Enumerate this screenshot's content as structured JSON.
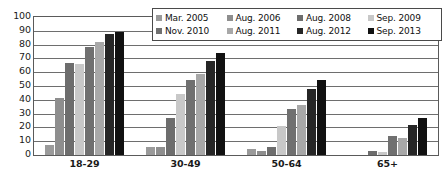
{
  "chart_data": {
    "type": "bar",
    "title": "",
    "xlabel": "",
    "ylabel": "",
    "ylim": [
      0,
      100
    ],
    "ytick_step": 10,
    "yticks": [
      "100",
      "90",
      "80",
      "70",
      "60",
      "50",
      "40",
      "30",
      "20",
      "10",
      "0"
    ],
    "grid": true,
    "legend_position": "top-right",
    "categories": [
      "18-29",
      "30-49",
      "50-64",
      "65+"
    ],
    "series": [
      {
        "name": "Mar. 2005",
        "color": "#9a9a9a",
        "values": [
          7,
          6,
          4,
          0
        ]
      },
      {
        "name": "Aug. 2006",
        "color": "#8e8e8e",
        "values": [
          41,
          6,
          3,
          0
        ]
      },
      {
        "name": "Aug. 2008",
        "color": "#6d6d6d",
        "values": [
          67,
          27,
          6,
          3
        ]
      },
      {
        "name": "Sep. 2009",
        "color": "#c8c8c8",
        "values": [
          66,
          44,
          21,
          2
        ]
      },
      {
        "name": "Nov. 2010",
        "color": "#707070",
        "values": [
          78,
          54,
          33,
          14
        ]
      },
      {
        "name": "Aug. 2011",
        "color": "#a8a8a8",
        "values": [
          82,
          59,
          36,
          12
        ]
      },
      {
        "name": "Aug. 2012",
        "color": "#262626",
        "values": [
          88,
          68,
          48,
          22
        ]
      },
      {
        "name": "Sep. 2013",
        "color": "#111111",
        "values": [
          89,
          74,
          54,
          27
        ]
      }
    ]
  },
  "legend": {
    "rows": [
      [
        {
          "label": "Mar. 2005",
          "color": "#9a9a9a"
        },
        {
          "label": "Aug. 2006",
          "color": "#8e8e8e"
        },
        {
          "label": "Aug. 2008",
          "color": "#6d6d6d"
        },
        {
          "label": "Sep. 2009",
          "color": "#c8c8c8"
        }
      ],
      [
        {
          "label": "Nov. 2010",
          "color": "#707070"
        },
        {
          "label": "Aug. 2011",
          "color": "#a8a8a8"
        },
        {
          "label": "Aug. 2012",
          "color": "#262626"
        },
        {
          "label": "Sep. 2013",
          "color": "#111111"
        }
      ]
    ]
  },
  "axis": {
    "frame_color": "#5a5a5a",
    "grid_color": "#6e6e6e",
    "text_color": "#1a1a1a"
  }
}
